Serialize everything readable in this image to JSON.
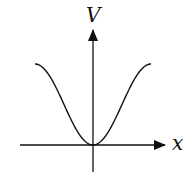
{
  "diagram": {
    "title": "",
    "y_axis_label": "V",
    "x_axis_label": "x",
    "curve": {
      "description": "potential well: V = A(1 - cos x) style bump, minimum at origin, plateaus on both sides",
      "shape": "inverted-gaussian-well"
    },
    "colors": {
      "stroke": "#111111",
      "background": "#ffffff"
    }
  }
}
